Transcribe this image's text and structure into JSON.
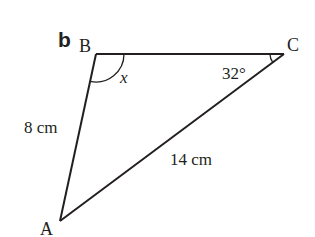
{
  "figure": {
    "part_label": "b",
    "vertices": [
      {
        "name": "A",
        "label": "A"
      },
      {
        "name": "B",
        "label": "B"
      },
      {
        "name": "C",
        "label": "C"
      }
    ],
    "sides": [
      {
        "between": "AB",
        "label": "8 cm"
      },
      {
        "between": "AC",
        "label": "14 cm"
      }
    ],
    "angles": [
      {
        "at": "B",
        "label": "x"
      },
      {
        "at": "C",
        "label": "32°"
      }
    ],
    "colors": {
      "stroke": "#231f20",
      "background": "#ffffff"
    }
  }
}
